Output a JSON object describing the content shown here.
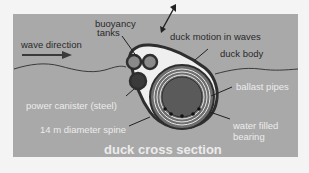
{
  "diagram": {
    "title": "duck cross section",
    "labels": {
      "wave_direction": "wave direction",
      "buoyancy_tanks_1": "buoyancy",
      "buoyancy_tanks_2": "tanks",
      "duck_motion": "duck motion in waves",
      "duck_body": "duck body",
      "ballast_pipes": "ballast pipes",
      "power_canister": "power canister (steel)",
      "spine": "14 m diameter spine",
      "water_filled_1": "water filled",
      "water_filled_2": "bearing"
    },
    "colors": {
      "background": "#a9a9a9",
      "body_outline": "#2e2e2e",
      "spine_fill": "#5a5a5a",
      "light_text": "#ececec",
      "dark_text": "#2a2a2a"
    }
  }
}
